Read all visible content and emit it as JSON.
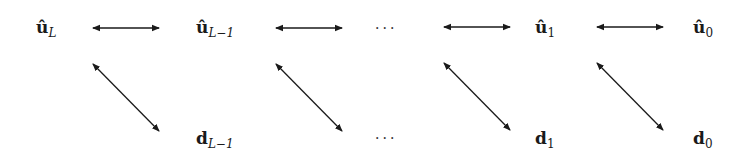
{
  "diagram": {
    "top_row": [
      {
        "base": "û",
        "sub": "L",
        "sub_italic": true,
        "x": 36,
        "y": 19
      },
      {
        "base": "û",
        "sub": "L−1",
        "sub_italic": true,
        "x": 196,
        "y": 19
      },
      {
        "ellipsis": "···",
        "x": 375,
        "y": 20
      },
      {
        "base": "û",
        "sub": "1",
        "sub_italic": false,
        "x": 535,
        "y": 19
      },
      {
        "base": "û",
        "sub": "0",
        "sub_italic": false,
        "x": 693,
        "y": 19
      }
    ],
    "bottom_row": [
      {
        "base": "d",
        "sub": "L−1",
        "sub_italic": true,
        "x": 196,
        "y": 130
      },
      {
        "ellipsis": "···",
        "x": 375,
        "y": 130
      },
      {
        "base": "d",
        "sub": "1",
        "sub_italic": false,
        "x": 535,
        "y": 130
      },
      {
        "base": "d",
        "sub": "0",
        "sub_italic": false,
        "x": 693,
        "y": 130
      }
    ],
    "horizontal_arrows": [
      {
        "x1": 93,
        "x2": 159,
        "y": 28
      },
      {
        "x1": 276,
        "x2": 342,
        "y": 28
      },
      {
        "x1": 444,
        "x2": 510,
        "y": 27
      },
      {
        "x1": 597,
        "x2": 663,
        "y": 27
      }
    ],
    "diagonal_arrows": [
      {
        "x1": 93,
        "y1": 64,
        "x2": 159,
        "y2": 131
      },
      {
        "x1": 276,
        "y1": 64,
        "x2": 342,
        "y2": 131
      },
      {
        "x1": 444,
        "y1": 63,
        "x2": 510,
        "y2": 130
      },
      {
        "x1": 597,
        "y1": 63,
        "x2": 663,
        "y2": 130
      }
    ],
    "colors": {
      "ink": "#1a1a1a",
      "background": "#ffffff"
    }
  }
}
